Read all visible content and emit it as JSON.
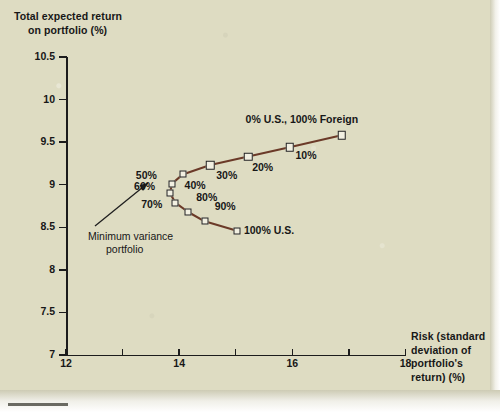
{
  "figure": {
    "y_axis_title_line1": "Total expected return",
    "y_axis_title_line2": "on portfolio (%)",
    "x_axis_title_line1": "Risk (standard",
    "x_axis_title_line2": "deviation of",
    "x_axis_title_line3": "portfolio's",
    "x_axis_title_line4": "return) (%)",
    "background_color": "#dedcc2",
    "line_color": "#6b3a28",
    "marker_fill": "#f2f0e2",
    "marker_edge": "#1f1f1f",
    "text_color": "#171717"
  },
  "annotations": {
    "endpoint_foreign": "0% U.S., 100% Foreign",
    "endpoint_domestic": "100% U.S.",
    "min_variance_line1": "Minimum variance",
    "min_variance_line2": "portfolio"
  },
  "chart_data": {
    "type": "line",
    "title": "",
    "xlabel": "Risk (standard deviation of portfolio's return) (%)",
    "ylabel": "Total expected return on portfolio (%)",
    "xlim": [
      12,
      18
    ],
    "ylim": [
      7,
      10.5
    ],
    "xticks": [
      12,
      13,
      14,
      15,
      16,
      17,
      18
    ],
    "xtick_labels": [
      "12",
      "",
      "14",
      "",
      "16",
      "",
      "18"
    ],
    "yticks": [
      7,
      7.5,
      8,
      8.5,
      9,
      9.5,
      10,
      10.5
    ],
    "ytick_labels": [
      "7",
      "7.5",
      "8",
      "8.5",
      "9",
      "9.5",
      "10",
      "10.5"
    ],
    "grid": false,
    "legend": false,
    "series": [
      {
        "name": "Efficient frontier (U.S. / Foreign mix)",
        "point_labels": [
          "100% U.S.",
          "90%",
          "80%",
          "70%",
          "60%",
          "50%",
          "40%",
          "30%",
          "20%",
          "10%",
          "0% U.S., 100% Foreign"
        ],
        "x": [
          15.02,
          14.45,
          14.16,
          13.93,
          13.84,
          13.87,
          14.06,
          14.55,
          15.22,
          15.95,
          16.87
        ],
        "y": [
          8.46,
          8.57,
          8.68,
          8.79,
          8.9,
          9.01,
          9.12,
          9.23,
          9.33,
          9.44,
          9.58
        ]
      }
    ]
  }
}
